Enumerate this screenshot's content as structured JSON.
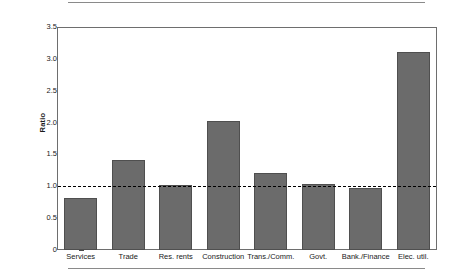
{
  "chart_data": {
    "type": "bar",
    "title": "",
    "xlabel": "",
    "ylabel": "Ratio",
    "categories": [
      "Services",
      "Trade",
      "Res. rents",
      "Construction",
      "Trans./Comm.",
      "Govt.",
      "Bank./Finance",
      "Elec. util."
    ],
    "values": [
      0.81,
      1.41,
      1.02,
      2.03,
      1.21,
      1.03,
      0.98,
      3.11
    ],
    "ylim": [
      0,
      3.5
    ],
    "ytick_labels": [
      "0",
      "0.5",
      "1.0",
      "1.5",
      "2.0",
      "2.5",
      "3.0",
      "3.5"
    ],
    "ytick_values": [
      0,
      0.5,
      1.0,
      1.5,
      2.0,
      2.5,
      3.0,
      3.5
    ],
    "yminor_step": 0.25,
    "grid": false,
    "legend": null,
    "reference_line": {
      "value": 1.0,
      "style": "dashed",
      "color": "#000000"
    },
    "bar_color": "#6b6b6b",
    "bar_edge_color": "#4f4f4f",
    "frame_color": "#6e6e6e",
    "rule_color": "#8a8a8a"
  }
}
